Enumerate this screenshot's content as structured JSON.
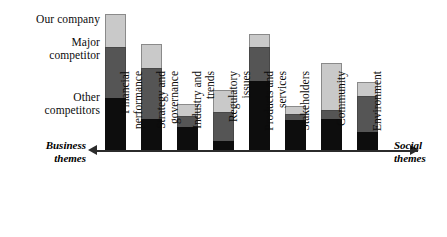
{
  "chart_data": {
    "type": "bar",
    "title": "",
    "subtitle": "",
    "xlabel": "",
    "ylabel": "",
    "stacked": true,
    "orientation": "vertical",
    "grid": false,
    "legend_position": "left",
    "axis_labels": {
      "left": "Business\nthemes",
      "right": "Social\nthemes"
    },
    "categories": [
      "Financial\nperformance",
      "Strategy and\ngovernance",
      "Industry and\ntrends",
      "Regulatory\nissues",
      "Products and\nservices",
      "Stakeholders",
      "Community",
      "Environment"
    ],
    "series": [
      {
        "name": "Other\ncompetitors",
        "color": "#0d0d0d",
        "values": [
          54,
          33,
          25,
          11,
          71,
          32,
          33,
          20
        ]
      },
      {
        "name": "Major\ncompetitor",
        "color": "#555555",
        "values": [
          52,
          52,
          12,
          30,
          35,
          7,
          10,
          37
        ]
      },
      {
        "name": "Our company",
        "color": "#c9c9c9",
        "values": [
          34,
          25,
          13,
          23,
          14,
          9,
          48,
          15
        ]
      }
    ],
    "totals": [
      140,
      110,
      50,
      64,
      120,
      48,
      91,
      72
    ],
    "ylim": [
      0,
      151
    ]
  },
  "legend": {
    "items": [
      {
        "label": "Our company",
        "color": "#c9c9c9"
      },
      {
        "label": "Major\ncompetitor",
        "color": "#555555"
      },
      {
        "label": "Other\ncompetitors",
        "color": "#0d0d0d"
      }
    ]
  },
  "colors": {
    "axis": "#2b2b2b",
    "background": "#ffffff",
    "text": "#0b0b0b"
  }
}
